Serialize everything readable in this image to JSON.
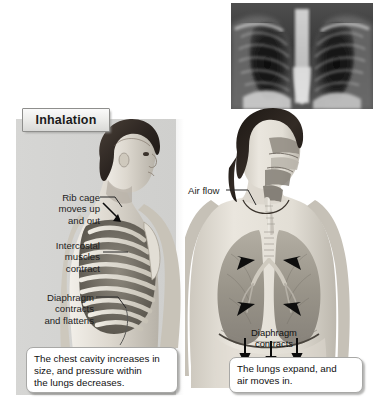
{
  "figure": {
    "title": "Inhalation",
    "background_color": "#d4d4d2",
    "page_background": "#ffffff"
  },
  "xray": {
    "name": "chest-x-ray",
    "description": "Chest X-ray showing lungs and rib cage"
  },
  "left_diagram": {
    "name": "side-view-rib-cage",
    "labels": [
      {
        "id": "rib-cage",
        "text": "Rib cage\nmoves up\nand out"
      },
      {
        "id": "intercostal",
        "text": "Intercostal\nmuscles\ncontract"
      },
      {
        "id": "diaphragm",
        "text": "Diaphragm\ncontracts\nand flattens"
      }
    ],
    "caption": "The chest cavity increases in\nsize, and pressure within\nthe lungs decreases."
  },
  "right_diagram": {
    "name": "front-view-lungs",
    "labels": [
      {
        "id": "air-flow",
        "text": "Air flow"
      },
      {
        "id": "diaphragm-contracts",
        "text": "Diaphragm\ncontracts"
      }
    ],
    "caption": "The lungs expand, and\nair moves in."
  }
}
